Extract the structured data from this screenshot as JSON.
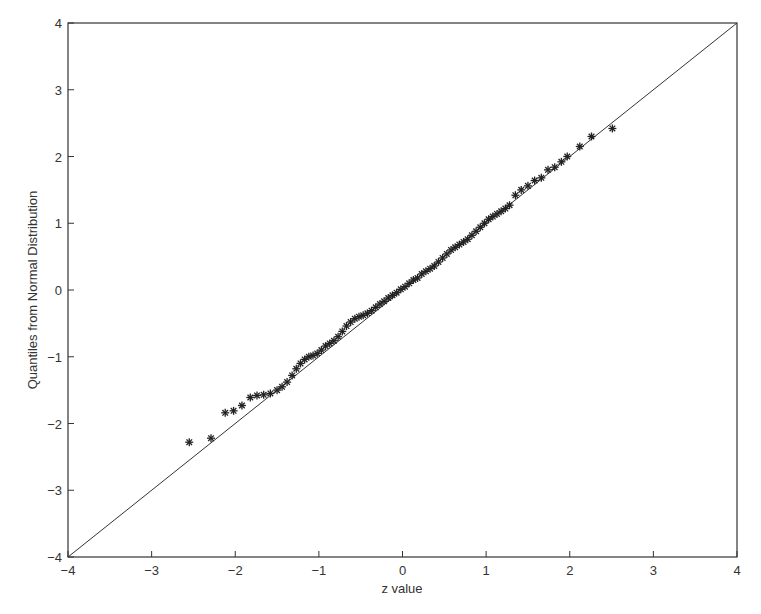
{
  "chart_data": {
    "type": "scatter",
    "title": "",
    "xlabel": "z value",
    "ylabel": "Quantiles from Normal Distribution",
    "xlim": [
      -4,
      4
    ],
    "ylim": [
      -4,
      4
    ],
    "xticks": [
      -4,
      -3,
      -2,
      -1,
      0,
      1,
      2,
      3,
      4
    ],
    "yticks": [
      -4,
      -3,
      -2,
      -1,
      0,
      1,
      2,
      3,
      4
    ],
    "xtick_labels": [
      "−4",
      "−3",
      "−2",
      "−1",
      "0",
      "1",
      "2",
      "3",
      "4"
    ],
    "ytick_labels": [
      "−4",
      "−3",
      "−2",
      "−1",
      "0",
      "1",
      "2",
      "3",
      "4"
    ],
    "grid": false,
    "legend": null,
    "marker": "*",
    "reference_line": {
      "from": [
        -4,
        -4
      ],
      "to": [
        4,
        4
      ],
      "label": "y = x"
    },
    "series": [
      {
        "name": "Q-Q points",
        "x": [
          -2.55,
          -2.29,
          -2.12,
          -2.02,
          -1.92,
          -1.82,
          -1.74,
          -1.66,
          -1.58,
          -1.5,
          -1.44,
          -1.38,
          -1.32,
          -1.27,
          -1.22,
          -1.17,
          -1.12,
          -1.07,
          -1.02,
          -0.97,
          -0.92,
          -0.87,
          -0.82,
          -0.77,
          -0.72,
          -0.67,
          -0.62,
          -0.57,
          -0.52,
          -0.47,
          -0.42,
          -0.37,
          -0.32,
          -0.27,
          -0.22,
          -0.17,
          -0.12,
          -0.07,
          -0.02,
          0.03,
          0.08,
          0.13,
          0.18,
          0.23,
          0.28,
          0.33,
          0.38,
          0.43,
          0.48,
          0.53,
          0.58,
          0.63,
          0.68,
          0.73,
          0.78,
          0.83,
          0.88,
          0.93,
          0.98,
          1.03,
          1.08,
          1.13,
          1.18,
          1.23,
          1.28,
          1.35,
          1.42,
          1.5,
          1.58,
          1.66,
          1.74,
          1.82,
          1.9,
          1.97,
          2.12,
          2.26,
          2.51
        ],
        "y": [
          -2.28,
          -2.22,
          -1.84,
          -1.81,
          -1.73,
          -1.61,
          -1.58,
          -1.57,
          -1.55,
          -1.5,
          -1.45,
          -1.38,
          -1.28,
          -1.18,
          -1.1,
          -1.04,
          -1.0,
          -0.98,
          -0.95,
          -0.9,
          -0.84,
          -0.8,
          -0.76,
          -0.7,
          -0.62,
          -0.54,
          -0.48,
          -0.43,
          -0.4,
          -0.38,
          -0.35,
          -0.31,
          -0.26,
          -0.21,
          -0.17,
          -0.12,
          -0.08,
          -0.04,
          0.01,
          0.05,
          0.1,
          0.15,
          0.18,
          0.24,
          0.28,
          0.32,
          0.36,
          0.42,
          0.48,
          0.54,
          0.6,
          0.64,
          0.68,
          0.72,
          0.76,
          0.82,
          0.88,
          0.94,
          1.0,
          1.06,
          1.1,
          1.14,
          1.18,
          1.22,
          1.27,
          1.42,
          1.5,
          1.56,
          1.64,
          1.68,
          1.8,
          1.84,
          1.92,
          2.0,
          2.15,
          2.3,
          2.42
        ]
      }
    ]
  },
  "layout": {
    "plot_left": 68,
    "plot_right": 737,
    "plot_top": 23,
    "plot_bottom": 557,
    "line_color": "#333333",
    "marker_color": "#222222"
  }
}
